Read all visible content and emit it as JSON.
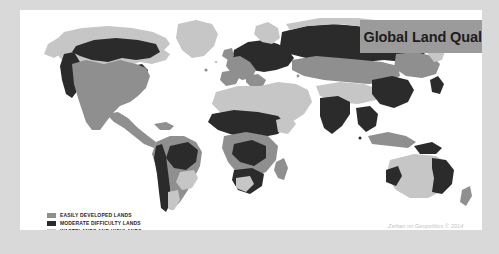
{
  "page": {
    "background_color": "#d9d9d9",
    "panel_color": "#ffffff"
  },
  "title": {
    "text": "Global Land Quality",
    "banner_color": "#9b9b9b",
    "text_color": "#1d1d1d"
  },
  "legend": {
    "items": [
      {
        "label": "EASILY DEVELOPED LANDS",
        "color": "#8f8f8f",
        "swatch_name": "legend-swatch-easily-developed"
      },
      {
        "label": "MODERATE DIFFICULTY LANDS",
        "color": "#2b2b2b",
        "swatch_name": "legend-swatch-moderate-difficulty"
      },
      {
        "label": "WASTELANDS AND HIGHLANDS",
        "color": "#c6c6c6",
        "swatch_name": "legend-swatch-wastelands-highlands"
      }
    ]
  },
  "attribution": {
    "text": "Zeihan on Geopolitics © 2014"
  },
  "map": {
    "ocean_color": "#ffffff",
    "categories": {
      "easily_developed": "#8f8f8f",
      "moderate_difficulty": "#2b2b2b",
      "wastelands_highlands": "#c6c6c6"
    }
  }
}
